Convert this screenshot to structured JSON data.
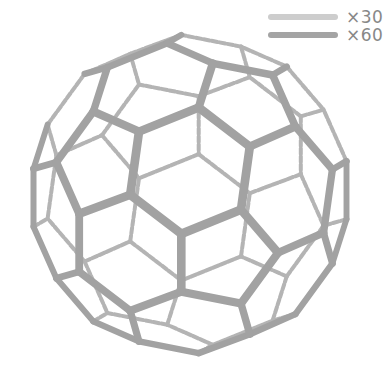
{
  "diagram": {
    "center": [
      190,
      194
    ],
    "radius": 160,
    "front_edge_color": "#a2a2a2",
    "back_edge_color": "#b4b4b4",
    "front_edge_width": 9,
    "back_edge_width": 4
  },
  "legend": {
    "items": [
      {
        "label": "×30",
        "color": "#cdcdcd"
      },
      {
        "label": "×60",
        "color": "#a4a4a4"
      }
    ]
  }
}
